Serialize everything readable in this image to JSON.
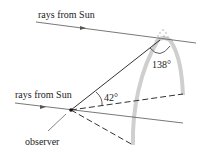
{
  "diagram": {
    "labels": {
      "rays_top": "rays from Sun",
      "rays_bottom": "rays from Sun",
      "angle_observer": "42°",
      "angle_drop": "138°",
      "observer": "observer"
    },
    "colors": {
      "line": "#444444",
      "rainbow_band": "#c8c8c8",
      "text": "#222222"
    }
  }
}
